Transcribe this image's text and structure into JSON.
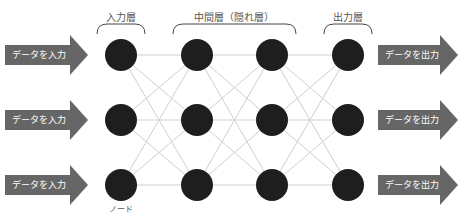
{
  "layers": [
    {
      "name": "input",
      "label": "入力層",
      "x": 121
    },
    {
      "name": "hidden-1",
      "x": 197
    },
    {
      "name": "hidden-2",
      "x": 272
    },
    {
      "name": "output",
      "label": "出力層",
      "x": 348
    }
  ],
  "hidden_label": "中間層（隠れ層）",
  "rows_y": [
    55,
    120,
    185
  ],
  "node_radius": 16,
  "node_caption": "ノード",
  "input_arrows": [
    {
      "label": "データを入力"
    },
    {
      "label": "データを入力"
    },
    {
      "label": "データを入力"
    }
  ],
  "output_arrows": [
    {
      "label": "データを出力"
    },
    {
      "label": "データを出力"
    },
    {
      "label": "データを出力"
    }
  ],
  "colors": {
    "node": "#1e1e1e",
    "edge": "#cfcfcf",
    "arrow": "#666666",
    "bracket": "#444444",
    "label": "#555555"
  }
}
